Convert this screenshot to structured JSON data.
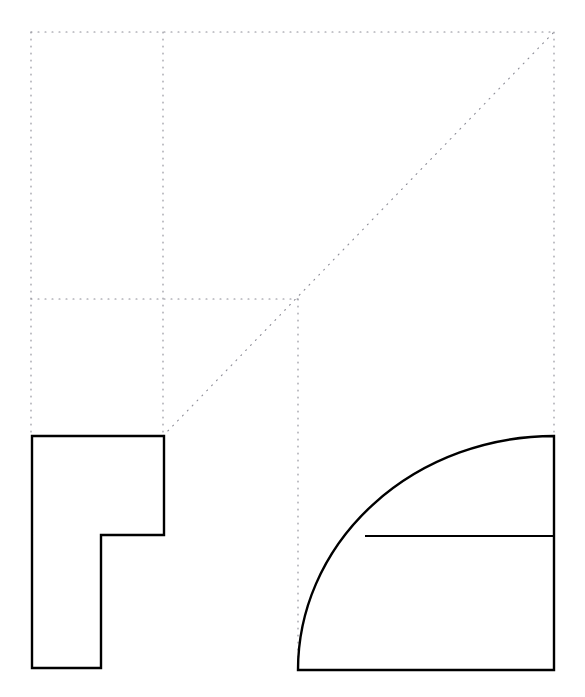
{
  "page": {
    "background_color": "#ffffff",
    "width": 585,
    "height": 697,
    "clipped_caption": "to do, shade this shape so that it matches the figure"
  },
  "style": {
    "stroke_color": "#000000",
    "stroke_width": 2.4,
    "thin_stroke_width": 1.8,
    "guide_color": "#8c8c96",
    "guide_dash": "1 6",
    "guide_width": 1.1
  },
  "figure": {
    "grid": {
      "left": 31,
      "top": 32,
      "right": 554,
      "mid_x": 163,
      "mid_y": 299,
      "third_x": 298,
      "bottom": 670
    },
    "guides": [
      {
        "name": "guide-top-horizontal",
        "x1": 31,
        "y1": 32,
        "x2": 554,
        "y2": 32
      },
      {
        "name": "guide-left-vertical",
        "x1": 31,
        "y1": 32,
        "x2": 31,
        "y2": 436
      },
      {
        "name": "guide-inner-vertical",
        "x1": 163,
        "y1": 32,
        "x2": 163,
        "y2": 436
      },
      {
        "name": "guide-right-vertical",
        "x1": 554,
        "y1": 32,
        "x2": 554,
        "y2": 436
      },
      {
        "name": "guide-middle-horizontal",
        "x1": 31,
        "y1": 299,
        "x2": 298,
        "y2": 299
      },
      {
        "name": "guide-center-vertical",
        "x1": 298,
        "y1": 299,
        "x2": 298,
        "y2": 670
      },
      {
        "name": "guide-diagonal",
        "x1": 163,
        "y1": 436,
        "x2": 554,
        "y2": 32
      }
    ],
    "l_shape": {
      "name": "l-shape-polygon",
      "points": "32,436 164,436 164,535 101,535 101,668 32,668",
      "vertices": [
        {
          "label": "top-left",
          "x": 32,
          "y": 436
        },
        {
          "label": "top-right",
          "x": 164,
          "y": 436
        },
        {
          "label": "step-right",
          "x": 164,
          "y": 535
        },
        {
          "label": "step-inner",
          "x": 101,
          "y": 535
        },
        {
          "label": "bottom-right",
          "x": 101,
          "y": 668
        },
        {
          "label": "bottom-left",
          "x": 32,
          "y": 668
        }
      ]
    },
    "quarter_ellipse": {
      "name": "quarter-ellipse-shape",
      "origin_x": 298,
      "origin_y": 670,
      "corner_x": 554,
      "corner_y": 436,
      "radius_x": 256,
      "radius_y": 234,
      "arc_path": "M 298 670 A 256 234 0 0 1 554 436 L 554 670 Z",
      "divider": {
        "name": "ellipse-divider-line",
        "x1": 365,
        "y1": 536,
        "x2": 554,
        "y2": 536
      }
    }
  }
}
